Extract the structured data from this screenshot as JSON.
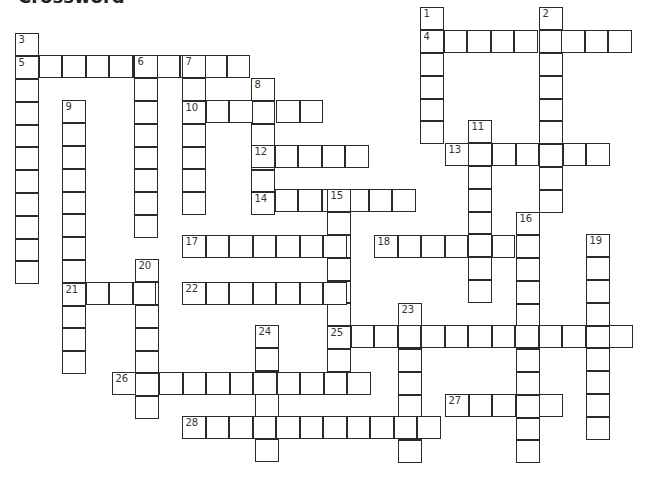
{
  "title": "Crossword",
  "cell": {
    "w": 23.5,
    "h": 22.8
  },
  "words": [
    {
      "num": "1",
      "dir": "down",
      "x": 421,
      "y": 8,
      "len": 6
    },
    {
      "num": "2",
      "dir": "down",
      "x": 540,
      "y": 8,
      "len": 9
    },
    {
      "num": "3",
      "dir": "down",
      "x": 16,
      "y": 34,
      "len": 11
    },
    {
      "num": "4",
      "dir": "across",
      "x": 421,
      "y": 31,
      "len": 9
    },
    {
      "num": "5",
      "dir": "across",
      "x": 16,
      "y": 56,
      "len": 10
    },
    {
      "num": "6",
      "dir": "down",
      "x": 135,
      "y": 56,
      "len": 8
    },
    {
      "num": "7",
      "dir": "down",
      "x": 183,
      "y": 56,
      "len": 7
    },
    {
      "num": "8",
      "dir": "down",
      "x": 252,
      "y": 79,
      "len": 6
    },
    {
      "num": "9",
      "dir": "down",
      "x": 63,
      "y": 101,
      "len": 12
    },
    {
      "num": "10",
      "dir": "across",
      "x": 183,
      "y": 101,
      "len": 6
    },
    {
      "num": "11",
      "dir": "down",
      "x": 469,
      "y": 121,
      "len": 8
    },
    {
      "num": "12",
      "dir": "across",
      "x": 252,
      "y": 146,
      "len": 5
    },
    {
      "num": "13",
      "dir": "across",
      "x": 446,
      "y": 144,
      "len": 7
    },
    {
      "num": "14",
      "dir": "across",
      "x": 252,
      "y": 190,
      "len": 7
    },
    {
      "num": "15",
      "dir": "down",
      "x": 328,
      "y": 190,
      "len": 9
    },
    {
      "num": "16",
      "dir": "down",
      "x": 517,
      "y": 213,
      "len": 11
    },
    {
      "num": "17",
      "dir": "across",
      "x": 183,
      "y": 236,
      "len": 7
    },
    {
      "num": "18",
      "dir": "across",
      "x": 375,
      "y": 236,
      "len": 7
    },
    {
      "num": "19",
      "dir": "down",
      "x": 587,
      "y": 235,
      "len": 9
    },
    {
      "num": "20",
      "dir": "down",
      "x": 136,
      "y": 260,
      "len": 7
    },
    {
      "num": "21",
      "dir": "across",
      "x": 63,
      "y": 283,
      "len": 4
    },
    {
      "num": "22",
      "dir": "across",
      "x": 183,
      "y": 283,
      "len": 7
    },
    {
      "num": "23",
      "dir": "down",
      "x": 399,
      "y": 304,
      "len": 7
    },
    {
      "num": "24",
      "dir": "down",
      "x": 256,
      "y": 326,
      "len": 6
    },
    {
      "num": "25",
      "dir": "across",
      "x": 328,
      "y": 326,
      "len": 13
    },
    {
      "num": "26",
      "dir": "across",
      "x": 113,
      "y": 373,
      "len": 11
    },
    {
      "num": "27",
      "dir": "across",
      "x": 446,
      "y": 395,
      "len": 5
    },
    {
      "num": "28",
      "dir": "across",
      "x": 183,
      "y": 417,
      "len": 11
    }
  ]
}
